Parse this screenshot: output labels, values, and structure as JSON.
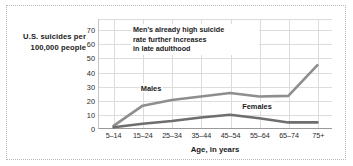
{
  "chart_data": {
    "type": "line",
    "title": "",
    "xlabel": "Age, in years",
    "ylabel": "U.S. suicides per 100,000 people",
    "categories": [
      "5–14",
      "15–24",
      "25–34",
      "35–44",
      "45–54",
      "55–64",
      "65–74",
      "75+"
    ],
    "yticks": [
      0,
      10,
      20,
      30,
      40,
      50,
      60,
      70
    ],
    "ylim": [
      0,
      78
    ],
    "grid": true,
    "legend_position": "inline",
    "series": [
      {
        "name": "Males",
        "color": "#8e8e8e",
        "values": [
          1.5,
          16,
          20,
          22.5,
          25,
          22.5,
          23,
          45
        ]
      },
      {
        "name": "Females",
        "color": "#6e6e6e",
        "values": [
          0.5,
          3,
          5,
          7.5,
          9.5,
          7,
          4,
          4
        ]
      }
    ],
    "annotations": [
      {
        "text": "Men's already high suicide rate further increases in late adulthood"
      }
    ]
  },
  "axis": {
    "y_caption_line1": "U.S. suicides per",
    "y_caption_line2": "100,000 people",
    "x_label": "Age, in years"
  },
  "annotation": {
    "line1": "Men's already high suicide",
    "line2": "rate further increases",
    "line3": "in late adulthood"
  },
  "legend": {
    "males": "Males",
    "females": "Females"
  },
  "yticks": {
    "t0": "0",
    "t1": "10",
    "t2": "20",
    "t3": "30",
    "t4": "40",
    "t5": "50",
    "t6": "60",
    "t7": "70"
  },
  "xticks": {
    "c0": "5–14",
    "c1": "15–24",
    "c2": "25–34",
    "c3": "35–44",
    "c4": "45–54",
    "c5": "55–64",
    "c6": "65–74",
    "c7": "75+"
  }
}
